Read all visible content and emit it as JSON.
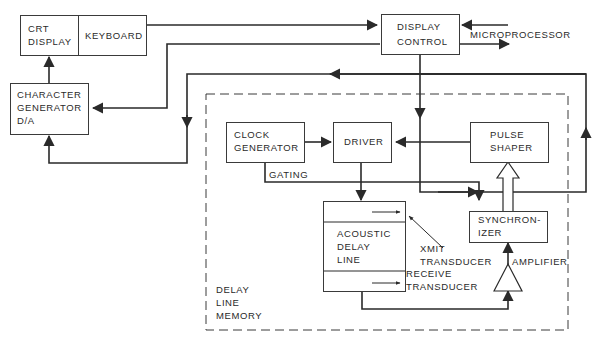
{
  "diagram": {
    "colors": {
      "line": "#2a2a2a",
      "background": "#ffffff",
      "text": "#2a2a2a"
    },
    "blocks": {
      "crt_display": {
        "line1": "CRT",
        "line2": "DISPLAY"
      },
      "keyboard": {
        "label": "KEYBOARD"
      },
      "display_control": {
        "line1": "DISPLAY",
        "line2": "CONTROL"
      },
      "character_generator": {
        "line1": "CHARACTER",
        "line2": "GENERATOR",
        "line3": "D/A"
      },
      "clock_generator": {
        "line1": "CLOCK",
        "line2": "GENERATOR"
      },
      "driver": {
        "label": "DRIVER"
      },
      "pulse_shaper": {
        "line1": "PULSE",
        "line2": "SHAPER"
      },
      "acoustic_delay_line": {
        "line1": "ACOUSTIC",
        "line2": "DELAY",
        "line3": "LINE"
      },
      "synchronizer": {
        "line1": "SYNCHRON-",
        "line2": "IZER"
      },
      "amplifier": {
        "label": "AMPLIFIER"
      }
    },
    "labels": {
      "microprocessor": "MICROPROCESSOR",
      "gating": "GATING",
      "xmit_transducer_1": "XMIT",
      "xmit_transducer_2": "TRANSDUCER",
      "receive_transducer_1": "RECEIVE",
      "receive_transducer_2": "TRANSDUCER",
      "delay_line_memory_1": "DELAY",
      "delay_line_memory_2": "LINE",
      "delay_line_memory_3": "MEMORY"
    },
    "groups": [
      {
        "name": "delay-line-memory",
        "style": "dashed",
        "contains": [
          "clock_generator",
          "driver",
          "pulse_shaper",
          "acoustic_delay_line",
          "synchronizer",
          "amplifier"
        ]
      }
    ],
    "connections": [
      {
        "from": "keyboard",
        "to": "display_control"
      },
      {
        "from": "display_control",
        "to": "character_generator"
      },
      {
        "from": "microprocessor",
        "to": "display_control"
      },
      {
        "from": "display_control",
        "to": "microprocessor"
      },
      {
        "from": "character_generator",
        "to": "crt_display"
      },
      {
        "from": "synchronizer",
        "to": "character_generator"
      },
      {
        "from": "display_control",
        "to": "driver"
      },
      {
        "from": "display_control",
        "to": "synchronizer"
      },
      {
        "from": "clock_generator",
        "to": "driver"
      },
      {
        "from": "clock_generator",
        "to": "synchronizer",
        "label": "GATING"
      },
      {
        "from": "pulse_shaper",
        "to": "driver"
      },
      {
        "from": "driver",
        "to": "acoustic_delay_line"
      },
      {
        "from": "acoustic_delay_line",
        "to": "amplifier"
      },
      {
        "from": "amplifier",
        "to": "synchronizer"
      },
      {
        "from": "synchronizer",
        "to": "pulse_shaper",
        "style": "hollow-arrow"
      }
    ]
  }
}
